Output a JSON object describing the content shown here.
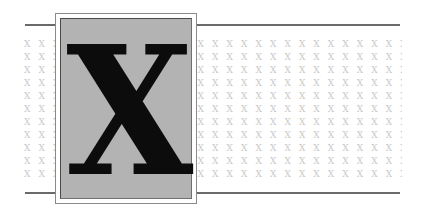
{
  "illustration": {
    "letter": "X",
    "pattern_text": "X X X X X X X X X X X X X X X X X X X X X X X X X X X X X X X X X X X X X X X X X X X X X X X X X X",
    "pattern_rows": 11,
    "colors": {
      "background": "#ffffff",
      "panel": "#b3b3b3",
      "letter": "#0c0c0c",
      "pattern": "#c9c9c9",
      "rules": "#6a6a6a"
    }
  }
}
